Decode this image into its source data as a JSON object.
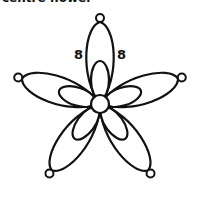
{
  "title": "centre flower",
  "diagram": {
    "stroke_color": "#111111",
    "background": "#ffffff",
    "center": {
      "x": 100,
      "y": 104,
      "r": 9
    },
    "outer_petals": {
      "count": 5,
      "angles_deg": [
        0,
        72,
        144,
        216,
        288
      ],
      "length": 82,
      "half_width": 14,
      "picot_radius": 4
    },
    "inner_petals": {
      "count": 5,
      "angles_deg": [
        0,
        72,
        144,
        216,
        288
      ],
      "length": 38,
      "half_width": 9
    },
    "labels": [
      {
        "text": "8",
        "x": 79,
        "y": 59
      },
      {
        "text": "8",
        "x": 117,
        "y": 59
      }
    ]
  }
}
